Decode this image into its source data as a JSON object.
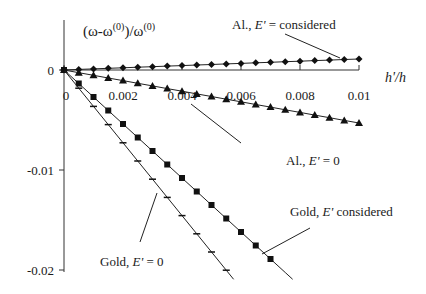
{
  "chart_data": {
    "type": "line",
    "title": "",
    "ylabel": "(ω-ω(0))/ω(0)",
    "ylabel_parts": {
      "a": "(ω-ω",
      "sup1": "(0)",
      "b": ")/ω",
      "sup2": "(0)"
    },
    "xlabel": "h'/h",
    "xlim": [
      0,
      0.01
    ],
    "ylim": [
      -0.02,
      0.0025
    ],
    "x_ticks": [
      0,
      0.002,
      0.004,
      0.006,
      0.008,
      0.01
    ],
    "x_tick_labels": [
      "0",
      "0.002",
      "0.004",
      "0.006",
      "0.008",
      "0.01"
    ],
    "y_ticks": [
      0,
      -0.01,
      -0.02
    ],
    "y_tick_labels": [
      "0",
      "-0.01",
      "-0.02"
    ],
    "grid": false,
    "legend": "none (inline annotations)",
    "series": [
      {
        "name": "Al., E' = considered",
        "marker": "diamond",
        "x": [
          0,
          0.0005,
          0.001,
          0.0015,
          0.002,
          0.0025,
          0.003,
          0.0035,
          0.004,
          0.0045,
          0.005,
          0.0055,
          0.006,
          0.0065,
          0.007,
          0.0075,
          0.008,
          0.0085,
          0.009,
          0.0095,
          0.01
        ],
        "values": [
          0,
          6e-05,
          0.00011,
          0.00017,
          0.00022,
          0.00028,
          0.00033,
          0.00039,
          0.00044,
          0.0005,
          0.00055,
          0.00061,
          0.00066,
          0.00072,
          0.00077,
          0.00083,
          0.00088,
          0.00094,
          0.00099,
          0.00105,
          0.0011
        ]
      },
      {
        "name": "Al., E' = 0",
        "marker": "triangle",
        "x": [
          0,
          0.0005,
          0.001,
          0.0015,
          0.002,
          0.0025,
          0.003,
          0.0035,
          0.004,
          0.0045,
          0.005,
          0.0055,
          0.006,
          0.0065,
          0.007,
          0.0075,
          0.008,
          0.0085,
          0.009,
          0.0095,
          0.01
        ],
        "values": [
          0,
          -0.00027,
          -0.00053,
          -0.0008,
          -0.00106,
          -0.00133,
          -0.00159,
          -0.00186,
          -0.00212,
          -0.00239,
          -0.00265,
          -0.00292,
          -0.00318,
          -0.00345,
          -0.00371,
          -0.00398,
          -0.00424,
          -0.00451,
          -0.00477,
          -0.00504,
          -0.0053
        ]
      },
      {
        "name": "Gold, E' considered",
        "marker": "square",
        "x": [
          0,
          0.0005,
          0.001,
          0.0015,
          0.002,
          0.0025,
          0.003,
          0.0035,
          0.004,
          0.0045,
          0.005,
          0.0055,
          0.006,
          0.0065,
          0.007,
          0.0075
        ],
        "values": [
          0,
          -0.00135,
          -0.0027,
          -0.00405,
          -0.0054,
          -0.00675,
          -0.0081,
          -0.00945,
          -0.0108,
          -0.01215,
          -0.0135,
          -0.01485,
          -0.0162,
          -0.01755,
          -0.0189,
          -0.02025
        ]
      },
      {
        "name": "Gold, E' = 0",
        "marker": "dash",
        "x": [
          0,
          0.0005,
          0.001,
          0.0015,
          0.002,
          0.0025,
          0.003,
          0.0035,
          0.004,
          0.0045,
          0.005,
          0.0055
        ],
        "values": [
          0,
          -0.00182,
          -0.00364,
          -0.00546,
          -0.00728,
          -0.0091,
          -0.01092,
          -0.01274,
          -0.01456,
          -0.01638,
          -0.0182,
          -0.02002
        ]
      }
    ],
    "annotations": [
      {
        "text_a": "Al., ",
        "text_e": "E'",
        "text_b": " = considered",
        "series": "Al., E' = considered",
        "at_x": 0.0095
      },
      {
        "text_a": "Al., ",
        "text_e": "E'",
        "text_b": " = 0",
        "series": "Al., E' = 0",
        "at_x": 0.006
      },
      {
        "text_a": "Gold, ",
        "text_e": "E'",
        "text_b": " considered",
        "series": "Gold, E' considered",
        "at_x": 0.0068
      },
      {
        "text_a": "Gold, ",
        "text_e": "E'",
        "text_b": " = 0",
        "series": "Gold, E' = 0",
        "at_x": 0.0026
      }
    ]
  }
}
